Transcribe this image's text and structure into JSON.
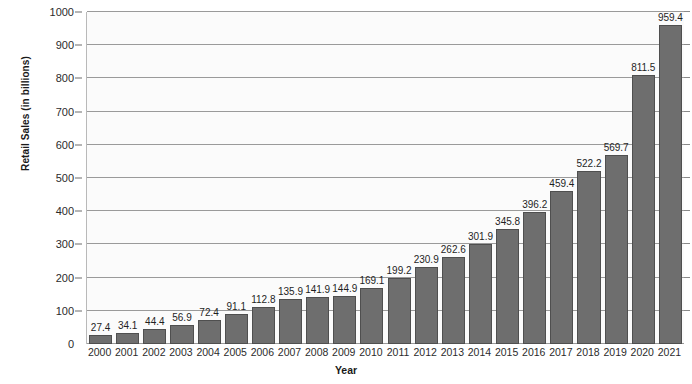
{
  "chart_data": {
    "type": "bar",
    "title": "",
    "xlabel": "Year",
    "ylabel": "Retail Sales (in billions)",
    "categories": [
      "2000",
      "2001",
      "2002",
      "2003",
      "2004",
      "2005",
      "2006",
      "2007",
      "2008",
      "2009",
      "2010",
      "2011",
      "2012",
      "2013",
      "2014",
      "2015",
      "2016",
      "2017",
      "2018",
      "2019",
      "2020",
      "2021"
    ],
    "values": [
      27.4,
      34.1,
      44.4,
      56.9,
      72.4,
      91.1,
      112.8,
      135.9,
      141.9,
      144.9,
      169.1,
      199.2,
      230.9,
      262.6,
      301.9,
      345.8,
      396.2,
      459.4,
      522.2,
      569.7,
      811.5,
      959.4
    ],
    "value_labels": [
      "27.4",
      "34.1",
      "44.4",
      "56.9",
      "72.4",
      "91.1",
      "112.8",
      "135.9",
      "141.9",
      "144.9",
      "169.1",
      "199.2",
      "230.9",
      "262.6",
      "301.9",
      "345.8",
      "396.2",
      "459.4",
      "522.2",
      "569.7",
      "811.5",
      "959.4"
    ],
    "ylim": [
      0,
      1000
    ],
    "ytick_values": [
      0,
      100,
      200,
      300,
      400,
      500,
      600,
      700,
      800,
      900,
      1000
    ],
    "ytick_labels": [
      "0",
      "100",
      "200",
      "300",
      "400",
      "500",
      "600",
      "700",
      "800",
      "900",
      "1000"
    ],
    "grid": true,
    "legend": "none",
    "bar_color": "#6e6e6e",
    "bar_border_color": "#4f4f4f",
    "gridline_color": "#9a9a9a",
    "plot_background": "#fbfbfb",
    "text_color": "#1f1f1f"
  }
}
